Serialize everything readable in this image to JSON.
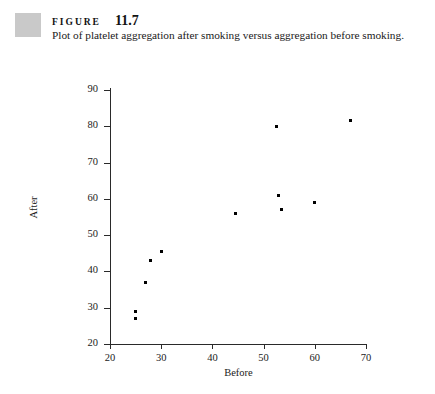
{
  "figure": {
    "label_word": "FIGURE",
    "number": "11.7",
    "caption": "Plot of platelet aggregation after smoking versus aggregation before smoking.",
    "swatch_color": "#c9c9c9"
  },
  "chart_data": {
    "type": "scatter",
    "title": "",
    "xlabel": "Before",
    "ylabel": "After",
    "xlim": [
      20,
      70
    ],
    "ylim": [
      20,
      90
    ],
    "xticks": [
      20,
      30,
      40,
      50,
      60,
      70
    ],
    "yticks": [
      20,
      30,
      40,
      50,
      60,
      70,
      80,
      90
    ],
    "xtick_labels": [
      "20",
      "30",
      "40",
      "50",
      "60",
      "70"
    ],
    "ytick_labels": [
      "20",
      "30",
      "40",
      "50",
      "60",
      "70",
      "80",
      "90"
    ],
    "grid": false,
    "legend": null,
    "marker": "square",
    "marker_color": "#000000",
    "points": [
      {
        "x": 25,
        "y": 27
      },
      {
        "x": 25,
        "y": 29
      },
      {
        "x": 27,
        "y": 37
      },
      {
        "x": 28,
        "y": 43
      },
      {
        "x": 30,
        "y": 45.5
      },
      {
        "x": 44.5,
        "y": 56
      },
      {
        "x": 52.5,
        "y": 80
      },
      {
        "x": 53,
        "y": 61
      },
      {
        "x": 53.5,
        "y": 57
      },
      {
        "x": 60,
        "y": 59
      },
      {
        "x": 67,
        "y": 81.5
      }
    ]
  }
}
